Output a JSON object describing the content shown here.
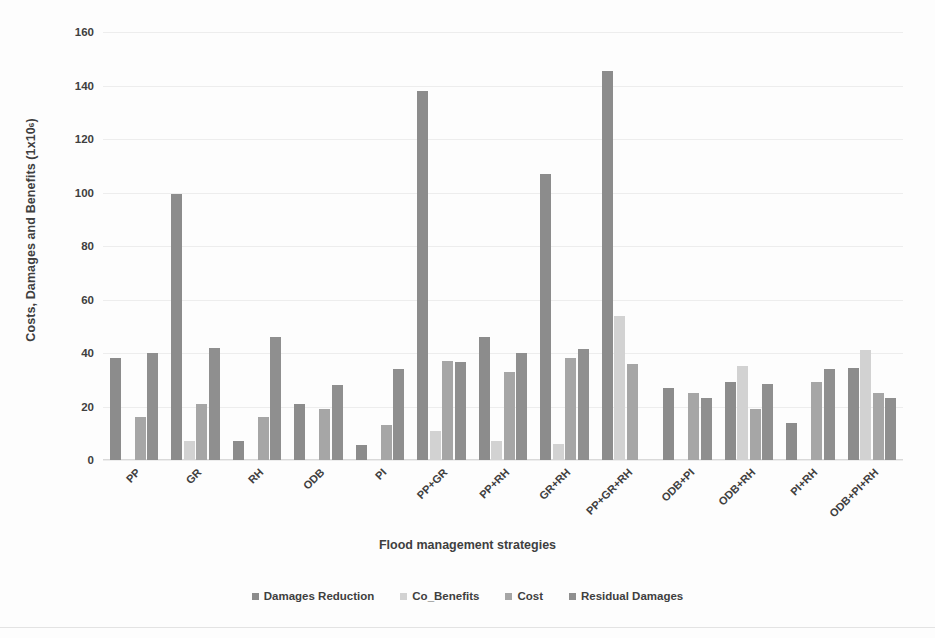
{
  "chart_data": {
    "type": "bar",
    "title": "",
    "xlabel": "Flood management strategies",
    "ylabel": "Costs, Damages and Benefits (1x10",
    "ylabel_exponent": "6",
    "ylabel_tail": ")",
    "ylim": [
      0,
      160
    ],
    "yticks": [
      0,
      20,
      40,
      60,
      80,
      100,
      120,
      140,
      160
    ],
    "ytick_labels": [
      "0",
      "20",
      "40",
      "60",
      "80",
      "100",
      "120",
      "140",
      "160"
    ],
    "grid": true,
    "grid_axis": "y",
    "legend_position": "bottom-center",
    "categories": [
      "PP",
      "GR",
      "RH",
      "ODB",
      "PI",
      "PP+GR",
      "PP+RH",
      "GR+RH",
      "PP+GR+RH",
      "ODB+PI",
      "ODB+RH",
      "PI+RH",
      "ODB+PI+RH"
    ],
    "series": [
      {
        "name": "Damages Reduction",
        "color": "#8c8c8c",
        "values": [
          38,
          99.5,
          7,
          21,
          5.5,
          138,
          46,
          107,
          145.5,
          27,
          29,
          14,
          34.5
        ]
      },
      {
        "name": "Co_Benefits",
        "color": "#d2d2d2",
        "values": [
          0,
          7,
          0,
          0,
          0,
          11,
          7,
          6,
          54,
          0,
          35,
          0,
          41
        ]
      },
      {
        "name": "Cost",
        "color": "#a6a6a6",
        "values": [
          16,
          21,
          16,
          19,
          13,
          37,
          33,
          38,
          36,
          25,
          19,
          29,
          25
        ]
      },
      {
        "name": "Residual Damages",
        "color": "#8f8f8f",
        "values": [
          40,
          42,
          46,
          28,
          34,
          36.5,
          40,
          41.5,
          0,
          23,
          28.5,
          34,
          23
        ]
      }
    ]
  },
  "legend": {
    "items": [
      {
        "label": "Damages Reduction",
        "color": "#8c8c8c"
      },
      {
        "label": "Co_Benefits",
        "color": "#d2d2d2"
      },
      {
        "label": "Cost",
        "color": "#a6a6a6"
      },
      {
        "label": "Residual Damages",
        "color": "#8f8f8f"
      }
    ]
  }
}
